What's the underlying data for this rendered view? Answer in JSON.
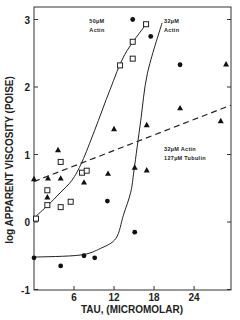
{
  "chart_data": {
    "type": "scatter",
    "title": "",
    "xlabel": "TAU, (MICROMOLAR)",
    "ylabel": "log APPARENT VISCOSITY (POISE)",
    "xlim": [
      0,
      29.5
    ],
    "ylim": [
      -1,
      3.2
    ],
    "xticks": [
      6,
      12,
      18,
      24
    ],
    "xtick_labels": [
      "6",
      "12",
      "18",
      "24"
    ],
    "yticks": [
      -1,
      0,
      1,
      2,
      3
    ],
    "ytick_labels": [
      "-1",
      "0",
      "1",
      "2",
      "3"
    ],
    "grid": false,
    "legend": "none (inline annotations)",
    "annotations": [
      {
        "lines": [
          "50µM",
          "Actin"
        ],
        "x": 8.3,
        "y": 2.95
      },
      {
        "lines": [
          "32µM",
          "Actin"
        ],
        "x": 19.5,
        "y": 2.95
      },
      {
        "lines": [
          "32µM Actin",
          "127µM Tubulin"
        ],
        "x": 19.5,
        "y": 1.05
      }
    ],
    "series": [
      {
        "name": "50µM Actin",
        "marker": "open-square",
        "points": [
          [
            0.3,
            0.05
          ],
          [
            2.0,
            0.25
          ],
          [
            2.0,
            0.47
          ],
          [
            4.0,
            0.22
          ],
          [
            4.0,
            0.89
          ],
          [
            5.5,
            0.3
          ],
          [
            7.2,
            0.73
          ],
          [
            7.9,
            0.76
          ],
          [
            12.9,
            2.32
          ],
          [
            14.8,
            2.42
          ],
          [
            14.8,
            2.67
          ],
          [
            16.8,
            2.93
          ]
        ],
        "fit_curve": [
          [
            0,
            0.06
          ],
          [
            2.1,
            0.25
          ],
          [
            3.9,
            0.43
          ],
          [
            5.7,
            0.62
          ],
          [
            7.2,
            0.89
          ],
          [
            9.1,
            1.36
          ],
          [
            11.4,
            1.96
          ],
          [
            13.6,
            2.48
          ],
          [
            16.8,
            2.93
          ]
        ]
      },
      {
        "name": "32µM Actin",
        "marker": "filled-circle",
        "points": [
          [
            0.0,
            -0.53
          ],
          [
            4.0,
            -0.65
          ],
          [
            7.5,
            -0.5
          ],
          [
            9.1,
            -0.53
          ],
          [
            11.0,
            0.31
          ],
          [
            15.1,
            -0.15
          ],
          [
            14.8,
            3.0
          ],
          [
            17.5,
            2.75
          ],
          [
            21.9,
            2.33
          ]
        ],
        "fit_curve": [
          [
            0,
            -0.52
          ],
          [
            6.9,
            -0.49
          ],
          [
            10.0,
            -0.39
          ],
          [
            12.3,
            -0.24
          ],
          [
            13.4,
            0.1
          ],
          [
            14.5,
            0.44
          ],
          [
            15.0,
            0.77
          ],
          [
            16.0,
            1.5
          ],
          [
            17.0,
            2.2
          ],
          [
            19.2,
            2.95
          ]
        ]
      },
      {
        "name": "32µM Actin + 127µM Tubulin",
        "marker": "filled-triangle",
        "points": [
          [
            0.0,
            0.64
          ],
          [
            2.1,
            0.65
          ],
          [
            2.0,
            0.37
          ],
          [
            3.6,
            1.07
          ],
          [
            4.0,
            0.65
          ],
          [
            7.5,
            0.59
          ],
          [
            11.1,
            0.72
          ],
          [
            12.0,
            1.38
          ],
          [
            15.1,
            0.81
          ],
          [
            16.9,
            0.77
          ],
          [
            16.9,
            1.44
          ],
          [
            21.9,
            1.69
          ],
          [
            28.0,
            1.5
          ],
          [
            28.8,
            2.34
          ]
        ],
        "fit_line": {
          "style": "dashed",
          "from": [
            0,
            0.6
          ],
          "to": [
            29.5,
            1.73
          ]
        }
      }
    ]
  }
}
